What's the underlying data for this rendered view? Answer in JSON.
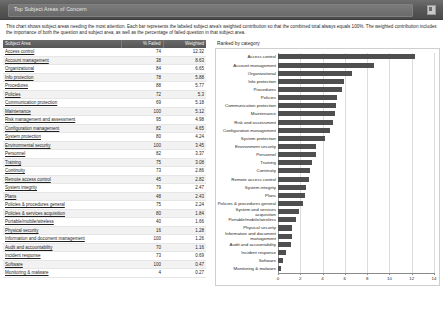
{
  "window": {
    "title": "Top Subject Areas of Concern",
    "header_icon": "restore-window-icon"
  },
  "description": "This chart shows subject areas needing the most attention. Each bar represents the labeled subject area's weighted contribution so that the combined total always equals 100%. The weighted contribution includes the importance of both the question and subject area, as well as the percentage of failed question in that subject area.",
  "table": {
    "columns": [
      "Subject Area",
      "% Failed",
      "Weighted"
    ],
    "rows": [
      {
        "name": "Access control",
        "failed": "74",
        "weighted": "12.32"
      },
      {
        "name": "Account management",
        "failed": "38",
        "weighted": "8.63"
      },
      {
        "name": "Organizational",
        "failed": "84",
        "weighted": "6.65"
      },
      {
        "name": "Info protection",
        "failed": "78",
        "weighted": "5.88"
      },
      {
        "name": "Procedures",
        "failed": "88",
        "weighted": "5.77"
      },
      {
        "name": "Policies",
        "failed": "72",
        "weighted": "5.3"
      },
      {
        "name": "Communication protection",
        "failed": "69",
        "weighted": "5.18"
      },
      {
        "name": "Maintenance",
        "failed": "100",
        "weighted": "5.12"
      },
      {
        "name": "Risk management and assessment",
        "failed": "95",
        "weighted": "4.98"
      },
      {
        "name": "Configuration management",
        "failed": "82",
        "weighted": "4.65"
      },
      {
        "name": "System protection",
        "failed": "80",
        "weighted": "4.24"
      },
      {
        "name": "Environmental security",
        "failed": "100",
        "weighted": "3.45"
      },
      {
        "name": "Personnel",
        "failed": "82",
        "weighted": "3.37"
      },
      {
        "name": "Training",
        "failed": "75",
        "weighted": "3.08"
      },
      {
        "name": "Continuity",
        "failed": "73",
        "weighted": "2.86"
      },
      {
        "name": "Remote access control",
        "failed": "45",
        "weighted": "2.82"
      },
      {
        "name": "System integrity",
        "failed": "79",
        "weighted": "2.47"
      },
      {
        "name": "Plans",
        "failed": "48",
        "weighted": "2.43"
      },
      {
        "name": "Policies & procedures general",
        "failed": "75",
        "weighted": "2.24"
      },
      {
        "name": "Policies & services acquisition",
        "failed": "80",
        "weighted": "1.84"
      },
      {
        "name": "Portable/mobile/wireless",
        "failed": "40",
        "weighted": "1.66"
      },
      {
        "name": "Physical security",
        "failed": "16",
        "weighted": "1.28"
      },
      {
        "name": "Information and document management",
        "failed": "100",
        "weighted": "1.26"
      },
      {
        "name": "Audit and accountability",
        "failed": "70",
        "weighted": "1.16"
      },
      {
        "name": "Incident response",
        "failed": "73",
        "weighted": "0.69"
      },
      {
        "name": "Software",
        "failed": "100",
        "weighted": "0.47"
      },
      {
        "name": "Monitoring & malware",
        "failed": "4",
        "weighted": "0.27"
      }
    ]
  },
  "chart_data": {
    "type": "bar",
    "orientation": "horizontal",
    "title": "Ranked by category",
    "xlabel": "",
    "ylabel": "",
    "xlim": [
      0,
      14
    ],
    "xticks": [
      0,
      2,
      4,
      6,
      8,
      10,
      12,
      14
    ],
    "grid": true,
    "legend": null,
    "bar_color": "#4f4f4f",
    "categories": [
      "Access control",
      "Account management",
      "Organizational",
      "Info protection",
      "Procedures",
      "Policies",
      "Communication protection",
      "Maintenance",
      "Risk and assessment",
      "Configuration management",
      "System protection",
      "Environment security",
      "Personnel",
      "Training",
      "Continuity",
      "Remote access control",
      "System integrity",
      "Plans",
      "Policies & procedures general",
      "System and services acquisition",
      "Portable/mobile/wireless",
      "Physical security",
      "Information and document management",
      "Audit and accountability",
      "Incident response",
      "Software",
      "Monitoring & malware"
    ],
    "values": [
      12.32,
      8.63,
      6.65,
      5.88,
      5.77,
      5.3,
      5.18,
      5.12,
      4.98,
      4.65,
      4.24,
      3.45,
      3.37,
      3.08,
      2.86,
      2.82,
      2.47,
      2.43,
      2.24,
      1.84,
      1.66,
      1.28,
      1.26,
      1.16,
      0.69,
      0.47,
      0.27
    ]
  }
}
